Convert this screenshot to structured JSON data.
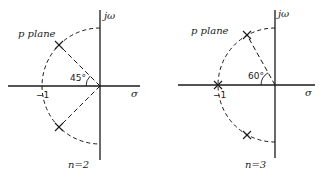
{
  "diagrams": [
    {
      "id": "n2",
      "plane_label": "p plane",
      "axis_vertical_label": "jω",
      "axis_horizontal_label": "σ",
      "minus_one_label": "−1",
      "angle_label": "45°",
      "caption": "n=2",
      "angle_deg": 45,
      "poles": [
        {
          "re": -0.7071,
          "im": 0.7071
        },
        {
          "re": -0.7071,
          "im": -0.7071
        }
      ]
    },
    {
      "id": "n3",
      "plane_label": "p plane",
      "axis_vertical_label": "jω",
      "axis_horizontal_label": "σ",
      "minus_one_label": "−1",
      "angle_label": "60°",
      "caption": "n=3",
      "angle_deg": 60,
      "poles": [
        {
          "re": -0.5,
          "im": 0.866
        },
        {
          "re": -1.0,
          "im": 0.0
        },
        {
          "re": -0.5,
          "im": -0.866
        }
      ]
    }
  ],
  "colors": {
    "ink": "#1a1a1a",
    "background": "#ffffff"
  }
}
